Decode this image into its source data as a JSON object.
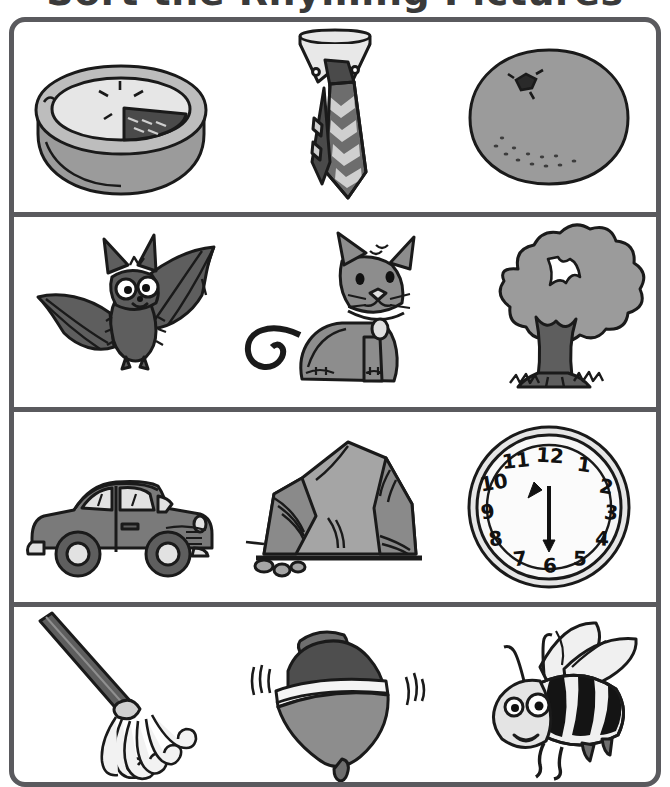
{
  "worksheet": {
    "title": "Sort the Rhyming Pictures",
    "border_color": "#5a5a5e",
    "background": "#ffffff",
    "grid": {
      "columns": 3,
      "rows": 4
    },
    "palette": {
      "outline": "#1a1a1a",
      "light": "#d9d9d9",
      "mid": "#9b9b9b",
      "dark": "#5a5a5a",
      "darker": "#3d3d3d",
      "white": "#f7f7f7"
    }
  },
  "cells": [
    {
      "row": 1,
      "col": 1,
      "name": "pie",
      "label": "Pie",
      "alt": "A baked pie in a dish with one slice cut showing dark filling"
    },
    {
      "row": 1,
      "col": 2,
      "name": "tie",
      "label": "Tie",
      "alt": "A necktie with a white collar and a zigzag chevron pattern"
    },
    {
      "row": 1,
      "col": 3,
      "name": "orange",
      "label": "Orange",
      "alt": "A round orange fruit with a small stem and dimpled peel"
    },
    {
      "row": 2,
      "col": 1,
      "name": "bat",
      "label": "Bat",
      "alt": "A cartoon bat with spread wings and big eyes"
    },
    {
      "row": 2,
      "col": 2,
      "name": "cat",
      "label": "Cat",
      "alt": "A grey cat sitting with a collar and round tag"
    },
    {
      "row": 2,
      "col": 3,
      "name": "tree",
      "label": "Tree",
      "alt": "A leafy tree with a thick trunk and grass at its base"
    },
    {
      "row": 3,
      "col": 1,
      "name": "car",
      "label": "Car",
      "alt": "A vintage sedan car seen from the side"
    },
    {
      "row": 3,
      "col": 2,
      "name": "rock",
      "label": "Rock",
      "alt": "A large grey boulder with small pebbles beside it"
    },
    {
      "row": 3,
      "col": 3,
      "name": "clock",
      "label": "Clock",
      "alt": "A round wall clock face with numbers 1 through 12"
    },
    {
      "row": 4,
      "col": 1,
      "name": "mop",
      "label": "Mop",
      "alt": "A mop with a long handle and stringy head"
    },
    {
      "row": 4,
      "col": 2,
      "name": "top",
      "label": "Top",
      "alt": "A spinning top toy with motion lines on both sides"
    },
    {
      "row": 4,
      "col": 3,
      "name": "bee",
      "label": "Bee",
      "alt": "A cartoon bumblebee with striped body, wings and antennae"
    }
  ],
  "clock": {
    "numerals": [
      "12",
      "1",
      "2",
      "3",
      "4",
      "5",
      "6",
      "7",
      "8",
      "9",
      "10",
      "11"
    ],
    "hour_hand_points_to": "11",
    "minute_hand_points_to": "6"
  }
}
